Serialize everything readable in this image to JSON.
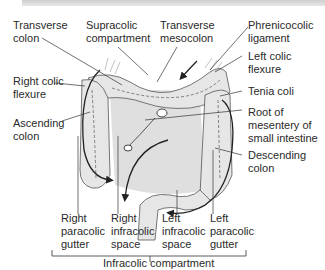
{
  "diagram": {
    "labels_top": {
      "transverse_colon": "Transverse\ncolon",
      "supracolic_compartment": "Supracolic\ncompartment",
      "transverse_mesocolon": "Transverse\nmesocolon",
      "phrenicocolic_ligament": "Phrenicocolic\nligament"
    },
    "labels_left": {
      "right_colic_flexure": "Right colic\nflexure",
      "ascending_colon": "Ascending\ncolon"
    },
    "labels_right": {
      "left_colic_flexure": "Left colic\nflexure",
      "tenia_coli": "Tenia coli",
      "root_of_mesentery": "Root of\nmesentery of\nsmall intestine",
      "descending_colon": "Descending\ncolon"
    },
    "labels_bottom": {
      "right_paracolic_gutter": "Right\nparacolic\ngutter",
      "right_infracolic_space": "Right\ninfracolic\nspace",
      "left_infracolic_space": "Left\ninfracolic\nspace",
      "left_paracolic_gutter": "Left\nparacolic\ngutter"
    },
    "bracket_label": "Infracolic compartment",
    "colors": {
      "line": "#333333",
      "colon_fill": "#e4e4e4",
      "shadow_fill": "#cfcfcf",
      "text": "#2a2a2a"
    }
  }
}
